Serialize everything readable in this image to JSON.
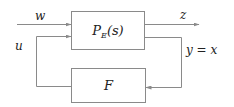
{
  "diagram": {
    "type": "block-diagram",
    "title": "",
    "stroke_color": "#8a8a8a",
    "text_color": "#222222",
    "blocks": [
      {
        "id": "plant",
        "label_main": "P",
        "label_sub": "E",
        "label_arg": "(s)",
        "full_label": "P_E(s)"
      },
      {
        "id": "controller",
        "label_main": "F",
        "full_label": "F"
      }
    ],
    "signals": {
      "w": "w",
      "u": "u",
      "z": "z",
      "y": "y = x"
    },
    "edges": [
      {
        "from": "external",
        "to": "plant",
        "signal": "w"
      },
      {
        "from": "controller",
        "to": "plant",
        "signal": "u"
      },
      {
        "from": "plant",
        "to": "external",
        "signal": "z"
      },
      {
        "from": "plant",
        "to": "controller",
        "signal": "y = x"
      }
    ]
  }
}
